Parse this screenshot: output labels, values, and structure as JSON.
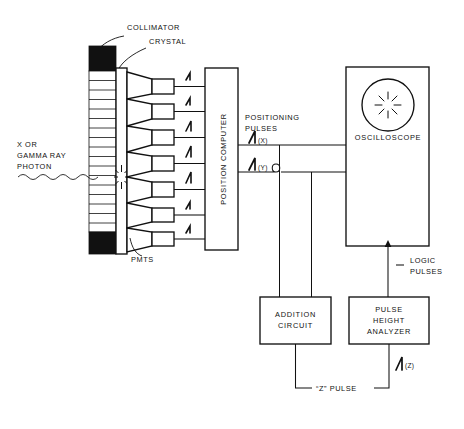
{
  "diagram": {
    "ink_color": "#111111",
    "background_color": "#ffffff"
  },
  "labels": {
    "collimator": "COLLIMATOR",
    "crystal": "CRYSTAL",
    "pmts": "PMTS",
    "photon_line1": "X OR",
    "photon_line2": "GAMMA RAY",
    "photon_line3": "PHOTON",
    "position_computer": "POSITION COMPUTER",
    "positioning_pulses_line1": "POSITIONING",
    "positioning_pulses_line2": "PULSES",
    "pulse_x": "(X)",
    "pulse_y": "(Y)",
    "pulse_z": "(Z)",
    "oscilloscope": "OSCILLOSCOPE",
    "logic_pulses_line1": "LOGIC",
    "logic_pulses_line2": "PULSES",
    "addition_circuit_line1": "ADDITION",
    "addition_circuit_line2": "CIRCUIT",
    "pulse_height_analyzer_line1": "PULSE",
    "pulse_height_analyzer_line2": "HEIGHT",
    "pulse_height_analyzer_line3": "ANALYZER",
    "z_pulse": "“Z” PULSE"
  },
  "components": {
    "collimator": {
      "septa_count": 17,
      "top_block_present": true,
      "bottom_block_present": true
    },
    "pmt_array": {
      "count": 7,
      "amplifier_count": 7
    },
    "oscilloscope": {
      "crt_display": "starburst-scintillation"
    }
  },
  "icons": {
    "amplifier_pulse": "pulse-symbol",
    "scintillation": "starburst-icon",
    "wire_hop": "wire-crossover-hop",
    "photon_wave": "wavy-photon-ray"
  }
}
